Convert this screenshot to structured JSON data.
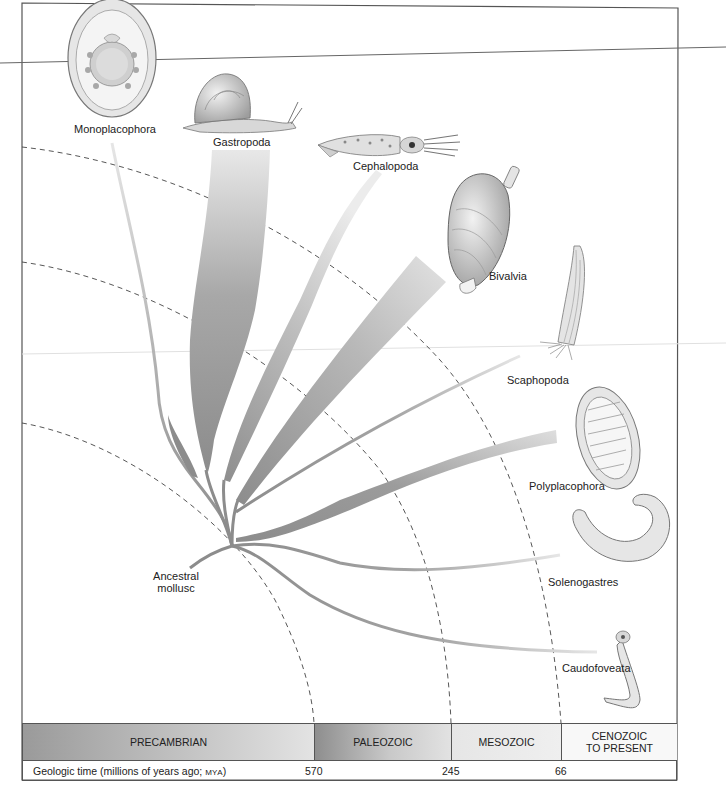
{
  "figure": {
    "type": "phylogenetic tree of molluscan classes over geologic time",
    "root_label": "Ancestral\nmollusc",
    "root_label_lines": [
      "Ancestral",
      "mollusc"
    ]
  },
  "taxa": [
    {
      "name": "Monoplacophora",
      "icon": "monoplacophoran-shell-icon"
    },
    {
      "name": "Gastropoda",
      "icon": "snail-icon"
    },
    {
      "name": "Cephalopoda",
      "icon": "squid-icon"
    },
    {
      "name": "Bivalvia",
      "icon": "clam-icon"
    },
    {
      "name": "Scaphopoda",
      "icon": "tusk-shell-icon"
    },
    {
      "name": "Polyplacophora",
      "icon": "chiton-icon"
    },
    {
      "name": "Solenogastres",
      "icon": "solenogaster-worm-icon"
    },
    {
      "name": "Caudofoveata",
      "icon": "caudofoveate-worm-icon"
    }
  ],
  "timescale": {
    "eras": [
      {
        "name": "PRECAMBRIAN",
        "lines": [
          "PRECAMBRIAN"
        ]
      },
      {
        "name": "PALEOZOIC",
        "lines": [
          "PALEOZOIC"
        ]
      },
      {
        "name": "MESOZOIC",
        "lines": [
          "MESOZOIC"
        ]
      },
      {
        "name": "CENOZOIC TO PRESENT",
        "lines": [
          "CENOZOIC",
          "TO PRESENT"
        ]
      }
    ],
    "axis_label": "Geologic time (millions of years ago; ",
    "axis_label_unit": "MYA",
    "axis_label_close": ")",
    "boundaries_mya": [
      "570",
      "245",
      "66"
    ]
  },
  "colors": {
    "branch_dark": "#8a8a8a",
    "branch_light": "#e4e4e4",
    "dashed_arc": "#444444",
    "frame": "#555555"
  }
}
